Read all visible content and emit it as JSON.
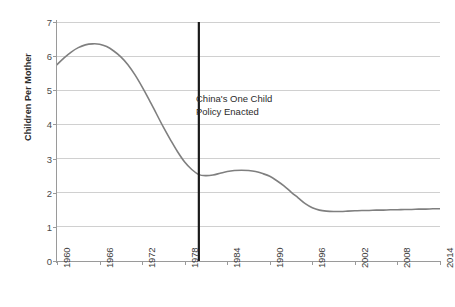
{
  "chart_data": {
    "type": "line",
    "title": "",
    "xlabel": "",
    "ylabel": "Children Per Mother",
    "xlim": [
      1960,
      2014
    ],
    "ylim": [
      0,
      7
    ],
    "grid": true,
    "legend": "none",
    "y_ticks": [
      0,
      1,
      2,
      3,
      4,
      5,
      6,
      7
    ],
    "y_tick_labels": [
      "0",
      "1",
      "2",
      "3",
      "4",
      "5",
      "6",
      "7"
    ],
    "x_ticks": [
      1960,
      1966,
      1972,
      1978,
      1984,
      1990,
      1996,
      2002,
      2008,
      2014
    ],
    "x_tick_labels": [
      "1960",
      "1966",
      "1972",
      "1978",
      "1984",
      "1990",
      "1996",
      "2002",
      "2008",
      "2014"
    ],
    "x_tick_rotation": -90,
    "series": [
      {
        "name": "Fertility rate",
        "color": "#7f7f7f",
        "x": [
          1960,
          1961,
          1962,
          1963,
          1964,
          1965,
          1966,
          1967,
          1968,
          1969,
          1970,
          1971,
          1972,
          1973,
          1974,
          1975,
          1976,
          1977,
          1978,
          1979,
          1980,
          1981,
          1982,
          1983,
          1984,
          1985,
          1986,
          1987,
          1988,
          1989,
          1990,
          1991,
          1992,
          1993,
          1994,
          1995,
          1996,
          1997,
          1998,
          1999,
          2000,
          2001,
          2002,
          2003,
          2004,
          2005,
          2006,
          2007,
          2008,
          2009,
          2010,
          2011,
          2012,
          2013,
          2014
        ],
        "values": [
          5.75,
          5.95,
          6.12,
          6.25,
          6.33,
          6.36,
          6.35,
          6.28,
          6.15,
          5.98,
          5.75,
          5.45,
          5.1,
          4.72,
          4.32,
          3.92,
          3.55,
          3.2,
          2.9,
          2.68,
          2.53,
          2.5,
          2.52,
          2.57,
          2.62,
          2.65,
          2.66,
          2.65,
          2.62,
          2.56,
          2.48,
          2.35,
          2.2,
          2.02,
          1.85,
          1.68,
          1.56,
          1.49,
          1.46,
          1.45,
          1.45,
          1.46,
          1.47,
          1.48,
          1.48,
          1.49,
          1.49,
          1.5,
          1.5,
          1.51,
          1.51,
          1.52,
          1.52,
          1.53,
          1.53
        ]
      }
    ],
    "annotations": [
      {
        "id": "one-child-policy",
        "type": "vline",
        "x": 1980,
        "color": "#1a1a1a",
        "label_line1": "China's One Child",
        "label_line2": "Policy Enacted"
      }
    ]
  },
  "colors": {
    "background": "#ffffff",
    "grid": "#d0d0d0",
    "axis": "#9a9a9a",
    "series": "#7f7f7f",
    "event_line": "#1a1a1a",
    "text": "#2b2b2b"
  }
}
